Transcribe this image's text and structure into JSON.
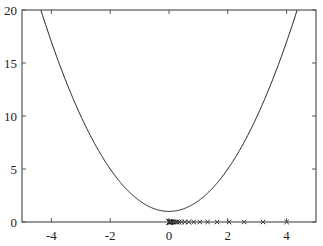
{
  "chart_data": {
    "type": "line",
    "title": "",
    "xlabel": "",
    "ylabel": "",
    "xlim": [
      -5,
      5
    ],
    "ylim": [
      0,
      20
    ],
    "grid": false,
    "legend": null,
    "x_ticks": [
      -4,
      -2,
      0,
      2,
      4
    ],
    "y_ticks": [
      0,
      5,
      10,
      15,
      20
    ],
    "x_tick_labels": [
      "-4",
      "-2",
      "0",
      "2",
      "4"
    ],
    "y_tick_labels": [
      "0",
      "5",
      "10",
      "15",
      "20"
    ],
    "series": [
      {
        "name": "f(x) = x^2 + 1",
        "style": "line",
        "color": "#222222",
        "function": "x^2 + 1",
        "x_range": [
          -5,
          5
        ]
      },
      {
        "name": "iterates",
        "style": "markers",
        "marker": "x",
        "color": "#222222",
        "x": [
          4.0,
          3.2,
          2.56,
          2.048,
          1.638,
          1.311,
          1.049,
          0.839,
          0.671,
          0.537,
          0.429,
          0.344,
          0.275,
          0.22,
          0.176,
          0.141,
          0.113,
          0.09,
          0.072,
          0.058,
          0.046,
          0.037,
          0.03,
          0.024,
          0.019,
          0.015,
          0.012,
          0.01,
          0.008,
          0.006,
          0.005,
          0.004,
          0.003,
          0.002,
          0.001
        ],
        "y": 0
      }
    ]
  },
  "frame": {
    "left": 22,
    "top": 10,
    "right": 316,
    "bottom": 222
  },
  "colors": {
    "axis": "#555555",
    "curve": "#222222",
    "markers": "#222222"
  }
}
